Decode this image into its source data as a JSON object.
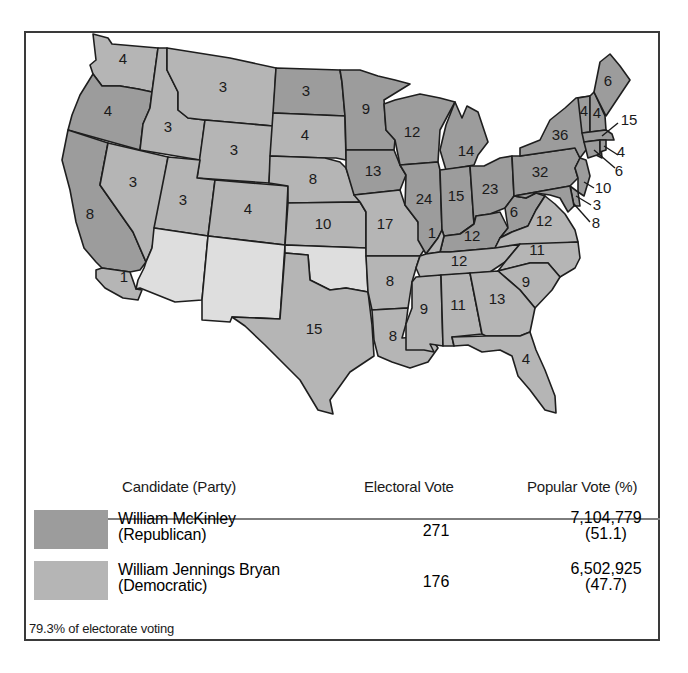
{
  "colors": {
    "republican": "#9c9c9c",
    "democratic": "#b5b5b5",
    "territory": "#dedede",
    "border": "#1e1e1e"
  },
  "map": {
    "states": [
      {
        "name": "Washington",
        "ev": "4",
        "party": "democratic"
      },
      {
        "name": "Oregon",
        "ev": "4",
        "party": "republican"
      },
      {
        "name": "California",
        "ev": "8",
        "party": "republican",
        "note": "split: 1 democratic"
      },
      {
        "name": "California-split",
        "ev": "1",
        "party": "democratic"
      },
      {
        "name": "Idaho",
        "ev": "3",
        "party": "democratic"
      },
      {
        "name": "Nevada",
        "ev": "3",
        "party": "democratic"
      },
      {
        "name": "Montana",
        "ev": "3",
        "party": "democratic"
      },
      {
        "name": "Wyoming",
        "ev": "3",
        "party": "democratic"
      },
      {
        "name": "Utah",
        "ev": "3",
        "party": "democratic"
      },
      {
        "name": "Colorado",
        "ev": "4",
        "party": "democratic"
      },
      {
        "name": "North Dakota",
        "ev": "3",
        "party": "republican"
      },
      {
        "name": "South Dakota",
        "ev": "4",
        "party": "democratic"
      },
      {
        "name": "Nebraska",
        "ev": "8",
        "party": "democratic"
      },
      {
        "name": "Kansas",
        "ev": "10",
        "party": "democratic"
      },
      {
        "name": "Texas",
        "ev": "15",
        "party": "democratic"
      },
      {
        "name": "Minnesota",
        "ev": "9",
        "party": "republican"
      },
      {
        "name": "Iowa",
        "ev": "13",
        "party": "republican"
      },
      {
        "name": "Missouri",
        "ev": "17",
        "party": "democratic"
      },
      {
        "name": "Arkansas",
        "ev": "8",
        "party": "democratic"
      },
      {
        "name": "Louisiana",
        "ev": "8",
        "party": "democratic"
      },
      {
        "name": "Wisconsin",
        "ev": "12",
        "party": "republican"
      },
      {
        "name": "Illinois",
        "ev": "24",
        "party": "republican"
      },
      {
        "name": "Michigan",
        "ev": "14",
        "party": "republican"
      },
      {
        "name": "Indiana",
        "ev": "15",
        "party": "republican"
      },
      {
        "name": "Ohio",
        "ev": "23",
        "party": "republican"
      },
      {
        "name": "Kentucky",
        "ev": "12",
        "party": "republican"
      },
      {
        "name": "Kentucky-split",
        "ev": "1",
        "party": "democratic"
      },
      {
        "name": "Tennessee",
        "ev": "12",
        "party": "democratic"
      },
      {
        "name": "Mississippi",
        "ev": "9",
        "party": "democratic"
      },
      {
        "name": "Alabama",
        "ev": "11",
        "party": "democratic"
      },
      {
        "name": "Georgia",
        "ev": "13",
        "party": "democratic"
      },
      {
        "name": "Florida",
        "ev": "4",
        "party": "democratic"
      },
      {
        "name": "South Carolina",
        "ev": "9",
        "party": "democratic"
      },
      {
        "name": "North Carolina",
        "ev": "11",
        "party": "democratic"
      },
      {
        "name": "Virginia",
        "ev": "12",
        "party": "democratic"
      },
      {
        "name": "West Virginia",
        "ev": "6",
        "party": "republican"
      },
      {
        "name": "Pennsylvania",
        "ev": "32",
        "party": "republican"
      },
      {
        "name": "New York",
        "ev": "36",
        "party": "republican"
      },
      {
        "name": "Vermont",
        "ev": "4",
        "party": "republican"
      },
      {
        "name": "New Hampshire",
        "ev": "4",
        "party": "republican"
      },
      {
        "name": "Maine",
        "ev": "6",
        "party": "republican"
      },
      {
        "name": "Massachusetts",
        "ev": "15",
        "party": "republican"
      },
      {
        "name": "Rhode Island",
        "ev": "4",
        "party": "republican"
      },
      {
        "name": "Connecticut",
        "ev": "6",
        "party": "republican"
      },
      {
        "name": "New Jersey",
        "ev": "10",
        "party": "republican"
      },
      {
        "name": "Delaware",
        "ev": "3",
        "party": "republican"
      },
      {
        "name": "Maryland",
        "ev": "8",
        "party": "republican"
      },
      {
        "name": "Arizona Territory",
        "ev": "",
        "party": "territory"
      },
      {
        "name": "New Mexico Territory",
        "ev": "",
        "party": "territory"
      },
      {
        "name": "Oklahoma Territory",
        "ev": "",
        "party": "territory"
      }
    ]
  },
  "legend": {
    "headers": {
      "candidate": "Candidate (Party)",
      "electoral": "Electoral Vote",
      "popular": "Popular Vote (%)"
    },
    "rows": [
      {
        "name": "William McKinley",
        "party": "(Republican)",
        "electoral": "271",
        "popular": "7,104,779",
        "percent": "(51.1)"
      },
      {
        "name": "William Jennings Bryan",
        "party": "(Democratic)",
        "electoral": "176",
        "popular": "6,502,925",
        "percent": "(47.7)"
      }
    ],
    "note": "79.3% of electorate voting"
  }
}
